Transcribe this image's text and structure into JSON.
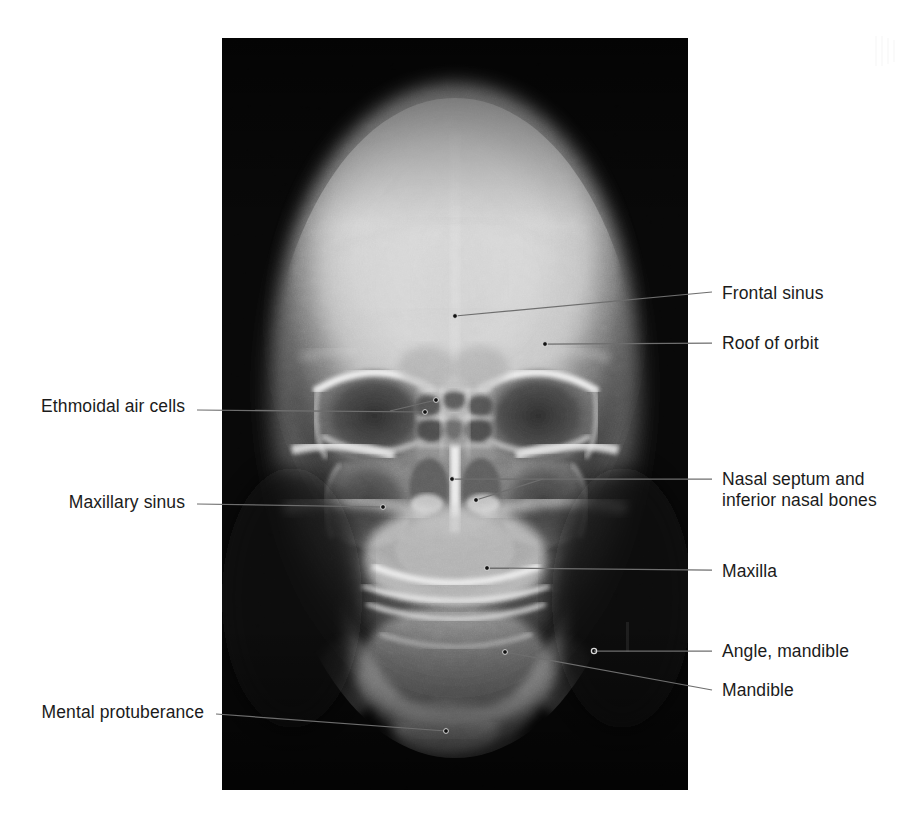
{
  "figure": {
    "modality": "radiograph",
    "view": "posteroanterior (PA) skull",
    "background_color": "#ffffff",
    "film_color": "#050505",
    "leader_line_color": "#6e6e6e",
    "label_text_color": "#1b1b1b"
  },
  "film": {
    "x": 222,
    "y": 38,
    "width": 466,
    "height": 752
  },
  "labels": [
    {
      "id": "frontal-sinus",
      "text": "Frontal sinus",
      "side": "right",
      "text_x": 722,
      "text_y": 283,
      "leader": {
        "from_x": 712,
        "from_y": 292,
        "to_x": 455,
        "to_y": 316,
        "marker": "dot"
      }
    },
    {
      "id": "roof-of-orbit",
      "text": "Roof of orbit",
      "side": "right",
      "text_x": 722,
      "text_y": 333,
      "leader": {
        "from_x": 712,
        "from_y": 343,
        "to_x": 545,
        "to_y": 344,
        "marker": "dot"
      }
    },
    {
      "id": "ethmoidal-air-cells",
      "text": "Ethmoidal air cells",
      "side": "left",
      "text_x": 38,
      "text_y": 396,
      "leader": {
        "from_x": 197,
        "from_y": 410,
        "to_x": 425,
        "to_y": 412,
        "marker": "dot"
      },
      "branch": {
        "from_x": 390,
        "from_y": 411,
        "to_x": 436,
        "to_y": 400,
        "marker": "dot"
      }
    },
    {
      "id": "nasal-septum-and-inferior-nasal-bones",
      "text": "Nasal septum and\ninferior nasal bones",
      "side": "right",
      "text_x": 722,
      "text_y": 469,
      "leader": {
        "from_x": 712,
        "from_y": 479,
        "to_x": 452,
        "to_y": 479,
        "marker": "dot"
      },
      "branch": {
        "from_x": 543,
        "from_y": 479,
        "to_x": 476,
        "to_y": 500,
        "marker": "dot"
      }
    },
    {
      "id": "maxillary-sinus",
      "text": "Maxillary sinus",
      "side": "left",
      "text_x": 66,
      "text_y": 492,
      "leader": {
        "from_x": 197,
        "from_y": 504,
        "to_x": 383,
        "to_y": 507,
        "marker": "dot"
      }
    },
    {
      "id": "maxilla",
      "text": "Maxilla",
      "side": "right",
      "text_x": 722,
      "text_y": 561,
      "leader": {
        "from_x": 712,
        "from_y": 570,
        "to_x": 487,
        "to_y": 568,
        "marker": "dot"
      }
    },
    {
      "id": "angle-mandible",
      "text": "Angle, mandible",
      "side": "right",
      "text_x": 722,
      "text_y": 641,
      "leader": {
        "from_x": 712,
        "from_y": 651,
        "to_x": 594,
        "to_y": 651,
        "marker": "circle"
      }
    },
    {
      "id": "mandible",
      "text": "Mandible",
      "side": "right",
      "text_x": 722,
      "text_y": 680,
      "leader": {
        "from_x": 712,
        "from_y": 690,
        "to_x": 505,
        "to_y": 652,
        "marker": "dot"
      }
    },
    {
      "id": "mental-protuberance",
      "text": "Mental protuberance",
      "side": "left",
      "text_x": 22,
      "text_y": 702,
      "leader": {
        "from_x": 216,
        "from_y": 714,
        "to_x": 446,
        "to_y": 731,
        "marker": "dot"
      }
    }
  ],
  "anatomy_regions": [
    {
      "id": "cranial-vault",
      "description": "calvaria, dense bright dome"
    },
    {
      "id": "orbit-left",
      "description": "left orbital cavity, dark"
    },
    {
      "id": "orbit-right",
      "description": "right orbital cavity, dark"
    },
    {
      "id": "nasal-cavity",
      "description": "midline nasal cavity with septum"
    },
    {
      "id": "maxillary-sinus-left",
      "description": "left maxillary antrum, dark"
    },
    {
      "id": "maxillary-sinus-right",
      "description": "right maxillary antrum, dark"
    },
    {
      "id": "mandible-body",
      "description": "mandibular body and symphysis"
    },
    {
      "id": "petrous-ridge",
      "description": "petrous temporal bone shadow"
    }
  ]
}
